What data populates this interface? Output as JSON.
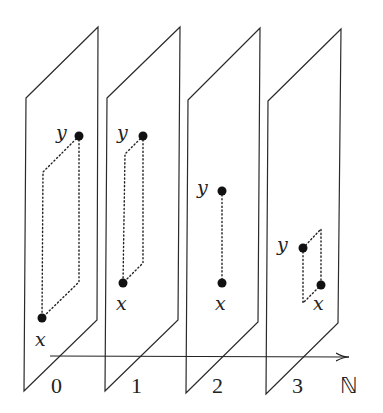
{
  "diagram": {
    "axis_label": "ℕ",
    "planes": [
      {
        "index_label": "0",
        "point_y_label": "y",
        "point_x_label": "x"
      },
      {
        "index_label": "1",
        "point_y_label": "y",
        "point_x_label": "x"
      },
      {
        "index_label": "2",
        "point_y_label": "y",
        "point_x_label": "x"
      },
      {
        "index_label": "3",
        "point_y_label": "y",
        "point_x_label": "x"
      }
    ]
  }
}
